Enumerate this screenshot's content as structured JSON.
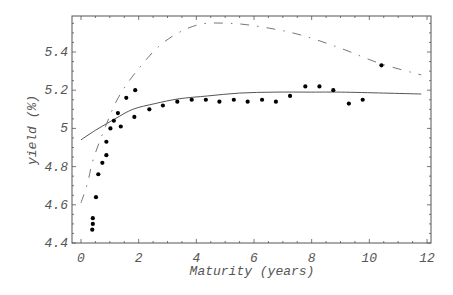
{
  "chart_data": {
    "type": "scatter",
    "title": "",
    "xlabel": "Maturity (years)",
    "ylabel": "yield (%)",
    "xlim": [
      -0.3,
      12.3
    ],
    "ylim": [
      4.4,
      5.6
    ],
    "xticks": [
      0,
      2,
      4,
      6,
      8,
      10,
      12
    ],
    "xtick_labels": [
      "0",
      "2",
      "4",
      "6",
      "8",
      "10",
      "12"
    ],
    "yticks": [
      4.4,
      4.6,
      4.8,
      5.0,
      5.2,
      5.4
    ],
    "ytick_labels": [
      "4.4",
      "4.6",
      "4.8",
      "5",
      "5.2",
      "5.4"
    ],
    "grid": false,
    "legend": null,
    "series": [
      {
        "name": "observed yields",
        "kind": "scatter",
        "color": "#000000",
        "x": [
          0.39,
          0.41,
          0.41,
          0.52,
          0.6,
          0.74,
          0.88,
          0.88,
          1.02,
          1.14,
          1.28,
          1.38,
          1.57,
          1.85,
          1.88,
          2.37,
          2.84,
          3.34,
          3.84,
          4.33,
          4.8,
          5.3,
          5.78,
          6.28,
          6.76,
          7.25,
          7.78,
          8.27,
          8.75,
          9.29,
          9.77,
          10.42
        ],
        "y": [
          4.47,
          4.5,
          4.53,
          4.64,
          4.76,
          4.82,
          4.86,
          4.93,
          5.0,
          5.04,
          5.08,
          5.01,
          5.16,
          5.06,
          5.2,
          5.1,
          5.12,
          5.14,
          5.15,
          5.15,
          5.14,
          5.15,
          5.14,
          5.15,
          5.14,
          5.17,
          5.22,
          5.22,
          5.2,
          5.13,
          5.15,
          5.33
        ]
      },
      {
        "name": "fitted curve (solid)",
        "kind": "line",
        "style": "solid",
        "color": "#555555",
        "x": [
          0,
          0.5,
          1.18,
          1.8,
          2.57,
          3.4,
          4.4,
          5.5,
          6.7,
          8.0,
          9.0,
          10.5,
          11.8
        ],
        "y": [
          4.94,
          4.99,
          5.05,
          5.1,
          5.13,
          5.155,
          5.17,
          5.185,
          5.19,
          5.19,
          5.19,
          5.185,
          5.18
        ]
      },
      {
        "name": "fitted curve (dash-dot)",
        "kind": "line",
        "style": "dashdot",
        "color": "#777777",
        "x": [
          0,
          0.22,
          0.43,
          0.85,
          1.29,
          1.93,
          2.86,
          4.0,
          5.17,
          6.32,
          7.6,
          9.0,
          10.37,
          11.8
        ],
        "y": [
          4.61,
          4.71,
          4.84,
          5.01,
          5.16,
          5.3,
          5.45,
          5.54,
          5.55,
          5.53,
          5.49,
          5.42,
          5.34,
          5.28
        ]
      }
    ]
  }
}
